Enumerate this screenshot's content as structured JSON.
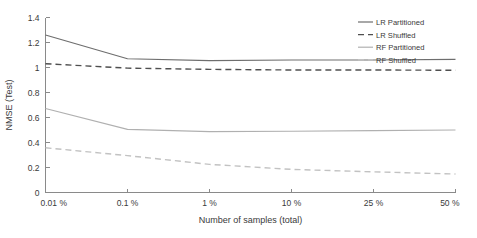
{
  "chart_data": {
    "type": "line",
    "title": "",
    "xlabel": "Number of samples (total)",
    "ylabel": "NMSE (Test)",
    "x_tick_labels": [
      "0.01 %",
      "0.1 %",
      "1 %",
      "10 %",
      "25 %",
      "50 %"
    ],
    "x_tick_values": [
      0.01,
      0.1,
      1,
      10,
      25,
      50
    ],
    "y_tick_labels": [
      "0",
      "0.2",
      "0.4",
      "0.6",
      "0.8",
      "1",
      "1.2",
      "1.4"
    ],
    "y_tick_values": [
      0,
      0.2,
      0.4,
      0.6,
      0.8,
      1,
      1.2,
      1.4
    ],
    "ylim": [
      0,
      1.4
    ],
    "grid": false,
    "legend_position": "top-right",
    "x": [
      "0.01 %",
      "0.1 %",
      "1 %",
      "10 %",
      "25 %",
      "50 %"
    ],
    "series": [
      {
        "name": "LR Partitioned",
        "style": "solid",
        "color": "#6e6e6e",
        "values": [
          1.26,
          1.07,
          1.055,
          1.06,
          1.06,
          1.065
        ]
      },
      {
        "name": "LR Shuffled",
        "style": "dashed",
        "color": "#4f4f4f",
        "values": [
          1.03,
          0.995,
          0.985,
          0.98,
          0.98,
          0.978
        ]
      },
      {
        "name": "RF Partitioned",
        "style": "solid",
        "color": "#b0b0b0",
        "values": [
          0.672,
          0.505,
          0.487,
          0.49,
          0.495,
          0.5
        ]
      },
      {
        "name": "RF Shuffled",
        "style": "dashed",
        "color": "#c2c2c2",
        "values": [
          0.358,
          0.295,
          0.225,
          0.185,
          0.165,
          0.148
        ]
      }
    ]
  },
  "legend": {
    "entries": [
      {
        "label": "LR Partitioned"
      },
      {
        "label": "LR Shuffled"
      },
      {
        "label": "RF Partitioned"
      },
      {
        "label": "RF Shuffled"
      }
    ]
  }
}
